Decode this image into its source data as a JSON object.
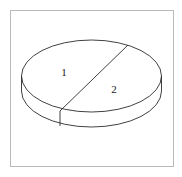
{
  "chart_data": {
    "type": "pie",
    "title": "",
    "subtitle": "",
    "xlabel": "",
    "ylabel": "",
    "style": "3d-line-art",
    "fill": "none",
    "stroke_color": "#2b2b2b",
    "border_color": "#b9b9b9",
    "background_color": "#ffffff",
    "grid": false,
    "legend": false,
    "legend_position": "none",
    "labels_inside_slices": true,
    "categories": [
      "1",
      "2"
    ],
    "values": [
      45,
      55
    ],
    "slices": [
      {
        "label": "1",
        "value": 45,
        "percent": 45,
        "start_angle_deg": 217,
        "end_angle_deg": 37,
        "label_x": 64,
        "label_y": 73,
        "fill": "none",
        "stroke": "#2b2b2b"
      },
      {
        "label": "2",
        "value": 55,
        "percent": 55,
        "start_angle_deg": 37,
        "end_angle_deg": 217,
        "label_x": 114,
        "label_y": 90,
        "fill": "none",
        "stroke": "#2b2b2b"
      }
    ],
    "geometry": {
      "center_x": 91.5,
      "center_y": 76,
      "radius_x": 70,
      "radius_y": 36,
      "depth": 15,
      "divider_start_x": 128,
      "divider_start_y": 45,
      "divider_end_x": 60,
      "divider_end_y": 111
    }
  },
  "frame": {
    "left": 10,
    "top": 10,
    "width": 164,
    "height": 157,
    "border_color": "#b9b9b9"
  }
}
